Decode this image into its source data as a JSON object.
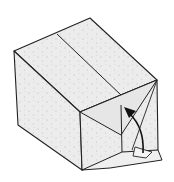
{
  "figure": {
    "colors": {
      "background": "#ffffff",
      "paper_fill": "#ececec",
      "paper_fill_dark": "#e0e0e0",
      "line": "#222222",
      "arrow": "#111111"
    },
    "annotations": {
      "arrow": "curved arrow indicating folding the bottom flap upward"
    }
  }
}
